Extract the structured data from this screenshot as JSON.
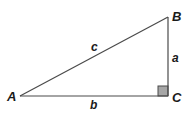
{
  "diagram": {
    "type": "right-triangle",
    "vertices": {
      "A": {
        "label": "A"
      },
      "B": {
        "label": "B"
      },
      "C": {
        "label": "C"
      }
    },
    "sides": {
      "a": {
        "label": "a",
        "between": [
          "B",
          "C"
        ]
      },
      "b": {
        "label": "b",
        "between": [
          "A",
          "C"
        ]
      },
      "c": {
        "label": "c",
        "between": [
          "A",
          "B"
        ]
      }
    },
    "right_angle_at": "C",
    "colors": {
      "line": "#4a4a4a",
      "right_angle_fill": "#a6a6a6",
      "label": "#1a1a1a"
    }
  }
}
